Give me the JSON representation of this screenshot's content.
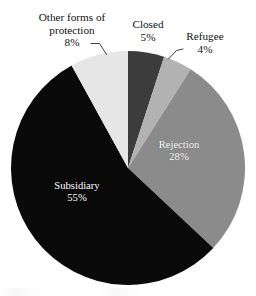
{
  "chart_data": {
    "type": "pie",
    "title": "",
    "subtitle": "",
    "xlabel": "",
    "ylabel": "",
    "legend_position": "none",
    "grid": false,
    "start_angle_deg": 0,
    "direction": "clockwise",
    "unit": "%",
    "categories": [
      "Closed",
      "Refugee",
      "Rejection",
      "Subsidiary",
      "Other forms of protection"
    ],
    "values": [
      5,
      4,
      28,
      55,
      8
    ],
    "slices": [
      {
        "label": "Closed",
        "value": 5,
        "value_text": "5%",
        "color": "#3c3c3c",
        "label_placement": "outside",
        "label_text_color": "#111111",
        "leader_line": false
      },
      {
        "label": "Refugee",
        "value": 4,
        "value_text": "4%",
        "color": "#b2b2b2",
        "label_placement": "outside",
        "label_text_color": "#111111",
        "leader_line": true
      },
      {
        "label": "Rejection",
        "value": 28,
        "value_text": "28%",
        "color": "#8b8b8b",
        "label_placement": "inside",
        "label_text_color": "#ffffff",
        "leader_line": false
      },
      {
        "label": "Subsidiary",
        "value": 55,
        "value_text": "55%",
        "color": "#0a0a0a",
        "label_placement": "inside",
        "label_text_color": "#ffffff",
        "leader_line": false
      },
      {
        "label": "Other forms of protection",
        "value": 8,
        "value_text": "8%",
        "color": "#e6e6e6",
        "label_placement": "outside",
        "label_text_color": "#111111",
        "leader_line": true
      }
    ]
  },
  "labels": {
    "other": {
      "line1": "Other forms of",
      "line2": "protection",
      "value": "8%"
    },
    "closed": {
      "name": "Closed",
      "value": "5%"
    },
    "refugee": {
      "name": "Refugee",
      "value": "4%"
    },
    "rejection": {
      "name": "Rejection",
      "value": "28%"
    },
    "subsidiary": {
      "name": "Subsidiary",
      "value": "55%"
    }
  },
  "colors": {
    "background": "#ffffff",
    "closed": "#3c3c3c",
    "refugee": "#b2b2b2",
    "rejection": "#8b8b8b",
    "subsidiary": "#0a0a0a",
    "other": "#e6e6e6",
    "text": "#111111",
    "inside_text": "#ffffff"
  }
}
